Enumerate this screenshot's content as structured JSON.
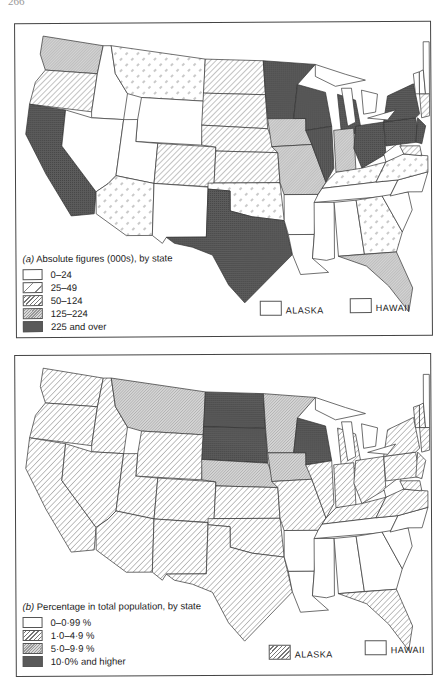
{
  "page_number": "266",
  "patterns": {
    "blank": {
      "fill": "#ffffff",
      "style": "none"
    },
    "sparse_dash": {
      "fill": "#ffffff",
      "style": "sparse-dashes",
      "stroke": "#777777"
    },
    "hatch": {
      "fill": "#ffffff",
      "style": "diagonal-lines",
      "stroke": "#666666"
    },
    "dense_hatch": {
      "fill": "#cfcfcf",
      "style": "dense-diagonal",
      "stroke": "#777777"
    },
    "dark": {
      "fill": "#5a5a5a",
      "style": "dark-crosshatch",
      "stroke": "#333333"
    }
  },
  "map_a": {
    "caption_label": "(a)",
    "caption_text": "Absolute figures (000s), by state",
    "legend": [
      {
        "label": "0–24",
        "pattern": "blank"
      },
      {
        "label": "25–49",
        "pattern": "sparse_dash"
      },
      {
        "label": "50–124",
        "pattern": "hatch"
      },
      {
        "label": "125–224",
        "pattern": "dense_hatch"
      },
      {
        "label": "225 and over",
        "pattern": "dark"
      }
    ],
    "insets": [
      {
        "label": "ALASKA",
        "pattern": "blank"
      },
      {
        "label": "HAWAII",
        "pattern": "blank"
      }
    ],
    "states": {
      "WA": "dense_hatch",
      "OR": "hatch",
      "CA": "dark",
      "ID": "blank",
      "NV": "blank",
      "MT": "sparse_dash",
      "WY": "blank",
      "UT": "blank",
      "AZ": "sparse_dash",
      "CO": "hatch",
      "NM": "blank",
      "ND": "hatch",
      "SD": "hatch",
      "NE": "hatch",
      "KS": "hatch",
      "OK": "sparse_dash",
      "TX": "dark",
      "MN": "dark",
      "IA": "dense_hatch",
      "MO": "dense_hatch",
      "AR": "blank",
      "LA": "blank",
      "WI": "dark",
      "IL": "dark",
      "MI": "dark",
      "IN": "dense_hatch",
      "OH": "dark",
      "KY": "sparse_dash",
      "TN": "blank",
      "MS": "blank",
      "AL": "blank",
      "GA": "sparse_dash",
      "FL": "dense_hatch",
      "SC": "blank",
      "NC": "blank",
      "VA": "sparse_dash",
      "WV": "blank",
      "PA": "dark",
      "NY": "dark",
      "NJ": "dark",
      "NE_states": "hatch",
      "MD": "hatch",
      "ME": "blank",
      "VT": "blank",
      "NH": "blank"
    }
  },
  "map_b": {
    "caption_label": "(b)",
    "caption_text": "Percentage in total population, by state",
    "legend": [
      {
        "label": "0–0·99 %",
        "pattern": "blank"
      },
      {
        "label": "1·0–4·9 %",
        "pattern": "hatch"
      },
      {
        "label": "5·0–9·9 %",
        "pattern": "dense_hatch"
      },
      {
        "label": "10·0% and higher",
        "pattern": "dark"
      }
    ],
    "insets": [
      {
        "label": "ALASKA",
        "pattern": "hatch"
      },
      {
        "label": "HAWAII",
        "pattern": "blank"
      }
    ],
    "states": {
      "WA": "hatch",
      "OR": "hatch",
      "CA": "hatch",
      "ID": "hatch",
      "NV": "hatch",
      "MT": "dense_hatch",
      "WY": "hatch",
      "UT": "hatch",
      "AZ": "hatch",
      "CO": "hatch",
      "NM": "hatch",
      "ND": "dark",
      "SD": "dark",
      "NE": "dense_hatch",
      "KS": "hatch",
      "OK": "hatch",
      "TX": "hatch",
      "MN": "dense_hatch",
      "IA": "dense_hatch",
      "MO": "hatch",
      "AR": "blank",
      "LA": "blank",
      "WI": "dark",
      "IL": "hatch",
      "MI": "hatch",
      "IN": "hatch",
      "OH": "hatch",
      "KY": "hatch",
      "TN": "blank",
      "MS": "blank",
      "AL": "blank",
      "GA": "blank",
      "FL": "hatch",
      "SC": "blank",
      "NC": "blank",
      "VA": "hatch",
      "WV": "blank",
      "PA": "hatch",
      "NY": "hatch",
      "NJ": "hatch",
      "NE_states": "hatch",
      "MD": "hatch",
      "ME": "blank",
      "VT": "hatch",
      "NH": "hatch"
    }
  }
}
